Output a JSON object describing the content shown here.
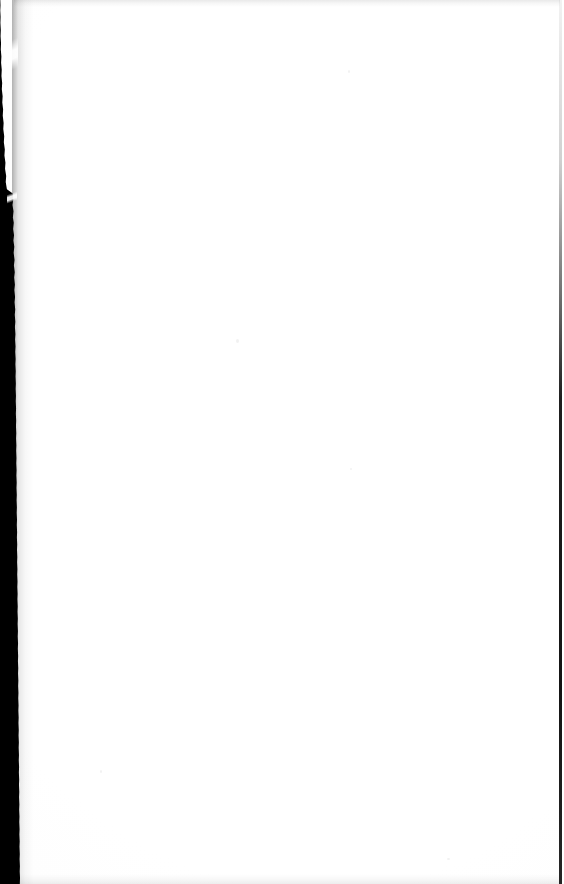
{
  "document": {
    "kind": "scanned-page",
    "page_type": "blank",
    "page_text": "",
    "page_number_label": "",
    "header_text": "",
    "footer_text": "",
    "caption": "",
    "width_px": 564,
    "height_px": 884
  },
  "artifacts": {
    "left_gutter": {
      "name": "binding-gutter-shadow",
      "label": "",
      "color": "#000000",
      "edge": "torn-jagged",
      "approx_width_px": 13
    },
    "right_trim": {
      "name": "right-edge-scan-line",
      "label": "",
      "color": "#000000",
      "approx_width_px": 3
    },
    "top_edge": {
      "name": "top-edge-noise-band",
      "label": "",
      "color": "#ededed"
    },
    "bottom_edge": {
      "name": "bottom-edge-noise-band",
      "label": "",
      "color": "#f0f0f0"
    },
    "paper": {
      "name": "paper-surface",
      "label": "",
      "color": "#fefefe"
    },
    "specks": [
      {
        "label": ""
      },
      {
        "label": ""
      },
      {
        "label": ""
      },
      {
        "label": ""
      },
      {
        "label": ""
      }
    ]
  }
}
